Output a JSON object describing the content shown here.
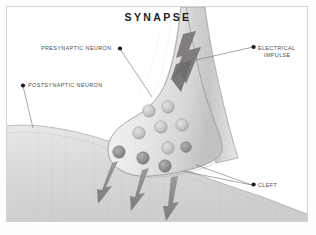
{
  "figure": {
    "title": "SYNAPSE",
    "type": "biological-illustration",
    "subject": "synapse",
    "style": "grayscale pencil shaded diagram",
    "border_color": "#d2d2d2",
    "background_color": "#ffffff"
  },
  "labels": {
    "presynaptic": {
      "text": "PRESYNAPTIC NEURON",
      "bullet": "●",
      "bullet_side": "right"
    },
    "postsynaptic": {
      "text": "POSTSYNAPTIC NEURON",
      "bullet": "●",
      "bullet_side": "left"
    },
    "electrical_line1": {
      "text": "ELECTRICAL",
      "bullet": "●",
      "bullet_side": "left"
    },
    "electrical_line2": {
      "text": "IMPULSE"
    },
    "cleft": {
      "text": "CLEFT",
      "bullet": "●",
      "bullet_side": "left"
    }
  },
  "colors": {
    "label_text": "#4b4b4b",
    "title_text": "#1d1d1d",
    "leader_line": "#6e6e6e",
    "bullet": "#1a1a1a",
    "terminal_fill": "#eceaea",
    "terminal_outline": "#9a9a9a",
    "membrane_fill": "#d8d6d4",
    "vesicle_light": "#c9c7c6",
    "vesicle_dark": "#8f8d8c",
    "arrow_gray": "#8c8c8c",
    "bolt_gray": "#6f6f6f"
  },
  "elements": {
    "axon_terminal": "presynaptic axon terminal bulb",
    "vesicle_count_interior": 6,
    "vesicle_count_membrane": 4,
    "electrical_impulse_arrow": "lightning bolt arrow pointing down the axon",
    "neurotransmitter_arrows": 3,
    "postsynaptic_membrane": "curved shaded cell surface"
  }
}
